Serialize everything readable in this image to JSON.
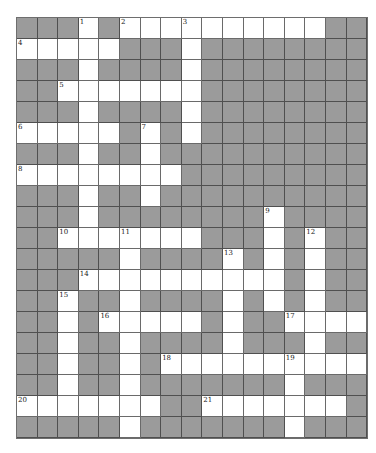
{
  "puzzle": {
    "type": "crossword",
    "columns": 17,
    "rows": 20,
    "colors": {
      "block": "#9b9b9b",
      "open": "#ffffff",
      "border": "#4f4f4f",
      "number": "#222222"
    },
    "grid": [
      "###.#.............##",
      ".....###.########",
      "###.####.########",
      "##.......########",
      "###.####.########",
      ".....#.#.########",
      "###.##.##########",
      "........#########",
      "###.##.##########",
      "###.########.####",
      "##.......###.#.##",
      "#####.####.#.#.##",
      "###.........#.#.##",
      "##.##.####.#.#.##",
      "##.#.....#.##....",
      "##.##.####.###.##",
      "##.##.#..........",
      "##.##.#######.###",
      ".......##.......#",
      "#####.#######.###"
    ],
    "numbers": [
      {
        "n": "1",
        "row": 0,
        "col": 3
      },
      {
        "n": "2",
        "row": 0,
        "col": 5
      },
      {
        "n": "3",
        "row": 0,
        "col": 8
      },
      {
        "n": "4",
        "row": 1,
        "col": 0
      },
      {
        "n": "5",
        "row": 3,
        "col": 2
      },
      {
        "n": "6",
        "row": 5,
        "col": 0
      },
      {
        "n": "7",
        "row": 5,
        "col": 6
      },
      {
        "n": "8",
        "row": 7,
        "col": 0
      },
      {
        "n": "9",
        "row": 9,
        "col": 12
      },
      {
        "n": "10",
        "row": 10,
        "col": 2
      },
      {
        "n": "11",
        "row": 10,
        "col": 5
      },
      {
        "n": "12",
        "row": 10,
        "col": 14
      },
      {
        "n": "13",
        "row": 11,
        "col": 10
      },
      {
        "n": "14",
        "row": 12,
        "col": 3
      },
      {
        "n": "15",
        "row": 13,
        "col": 2
      },
      {
        "n": "16",
        "row": 14,
        "col": 4
      },
      {
        "n": "17",
        "row": 14,
        "col": 13
      },
      {
        "n": "18",
        "row": 16,
        "col": 7
      },
      {
        "n": "19",
        "row": 16,
        "col": 13
      },
      {
        "n": "20",
        "row": 18,
        "col": 0
      },
      {
        "n": "21",
        "row": 18,
        "col": 9
      }
    ]
  }
}
